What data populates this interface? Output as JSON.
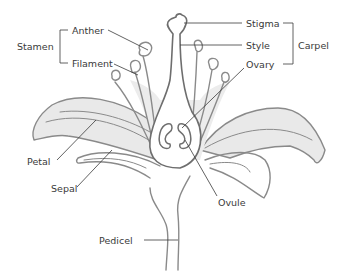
{
  "diagram": {
    "type": "flower-anatomy",
    "colors": {
      "outline": "#8a8a8a",
      "fill": "#e8e8e8",
      "leader": "#3a3a3a",
      "text": "#3a3a3a",
      "background": "#ffffff"
    },
    "labels": {
      "stamen": "Stamen",
      "anther": "Anther",
      "filament": "Filament",
      "stigma": "Stigma",
      "style": "Style",
      "ovary": "Ovary",
      "carpel": "Carpel",
      "petal": "Petal",
      "sepal": "Sepal",
      "ovule": "Ovule",
      "pedicel": "Pedicel"
    },
    "groups": [
      {
        "name": "Stamen",
        "members": [
          "Anther",
          "Filament"
        ]
      },
      {
        "name": "Carpel",
        "members": [
          "Stigma",
          "Style",
          "Ovary"
        ]
      }
    ]
  }
}
